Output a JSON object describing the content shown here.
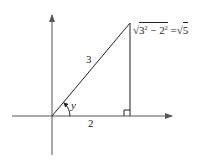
{
  "diagram": {
    "type": "right-triangle-on-axes",
    "labels": {
      "hypotenuse": "3",
      "adjacent": "2",
      "angle": "y",
      "opposite_expr": {
        "base1": "3",
        "exp1": "2",
        "minus": " − ",
        "base2": "2",
        "exp2": "2",
        "equals": " =",
        "result": "5"
      }
    },
    "colors": {
      "line": "#222222",
      "axis": "#555555"
    }
  }
}
